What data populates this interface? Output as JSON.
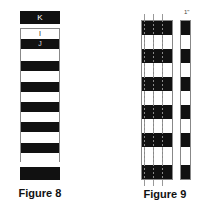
{
  "figures": [
    {
      "caption": "Figure 8",
      "top_bar_label": "K",
      "stripes": [
        {
          "color": "white",
          "label": "I"
        },
        {
          "color": "black",
          "label": "J"
        },
        {
          "color": "white",
          "label": ""
        },
        {
          "color": "black",
          "label": ""
        },
        {
          "color": "white",
          "label": ""
        },
        {
          "color": "black",
          "label": ""
        },
        {
          "color": "white",
          "label": ""
        },
        {
          "color": "black",
          "label": ""
        },
        {
          "color": "white",
          "label": ""
        },
        {
          "color": "black",
          "label": ""
        },
        {
          "color": "white",
          "label": ""
        },
        {
          "color": "black",
          "label": ""
        },
        {
          "color": "white",
          "label": ""
        }
      ]
    },
    {
      "caption": "Figure 9",
      "strip_label": "1\""
    }
  ]
}
